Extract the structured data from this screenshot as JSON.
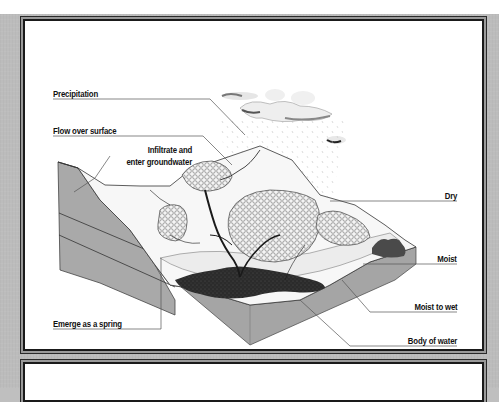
{
  "diagram": {
    "type": "water-cycle block diagram",
    "labels": {
      "precipitation": "Precipitation",
      "flow_over_surface": "Flow over surface",
      "infiltrate_line1": "Infiltrate and",
      "infiltrate_line2": "enter groundwater",
      "dry": "Dry",
      "moist": "Moist",
      "moist_to_wet": "Moist to wet",
      "body_of_water": "Body of water",
      "emerge_as_spring": "Emerge as a spring"
    },
    "colors": {
      "background": "#bcbcbc",
      "panel": "#ffffff",
      "border": "#1a1a1a",
      "soil_side": "#a8a8a8",
      "soil_side_dark": "#8f8f8f",
      "water": "#2a2a2a",
      "leader_line": "#555555",
      "label_text": "#111111"
    }
  }
}
